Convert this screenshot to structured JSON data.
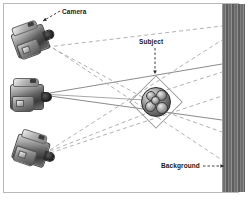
{
  "figure": {
    "type": "diagram",
    "width": 248,
    "height": 201,
    "background_color": "#ffffff",
    "frame_color": "#b9b9b9"
  },
  "annotations": {
    "camera": {
      "label": "Camera",
      "leader": "dashed-arrow",
      "points_to": "top-camera"
    },
    "subject": {
      "label": "Subject",
      "leader": "dashed-arrow",
      "points_to": "center-subject"
    },
    "background": {
      "label": "Background",
      "leader": "dashed-arrow",
      "points_to": "striped-band"
    }
  },
  "cameras": [
    {
      "id": "camera-top",
      "position": "upper-left",
      "rotation_deg": -20,
      "ray_style": "dashed"
    },
    {
      "id": "camera-middle",
      "position": "middle-left",
      "rotation_deg": 0,
      "ray_style": "solid"
    },
    {
      "id": "camera-bottom",
      "position": "lower-left",
      "rotation_deg": 18,
      "ray_style": "dashed"
    }
  ],
  "subject": {
    "id": "center-subject",
    "shape": "sphere-cluster",
    "halo": "diamond-outline"
  },
  "backdrop": {
    "id": "striped-band",
    "pattern": "vertical-stripes",
    "color_dark": "#5d5d5d",
    "color_light": "#8f8f8f"
  },
  "colors": {
    "solid_ray": "#6d6d6d",
    "dashed_ray": "#a8a8a8",
    "leader_line": "#2a2a2a",
    "text": "#1a1a1a"
  }
}
